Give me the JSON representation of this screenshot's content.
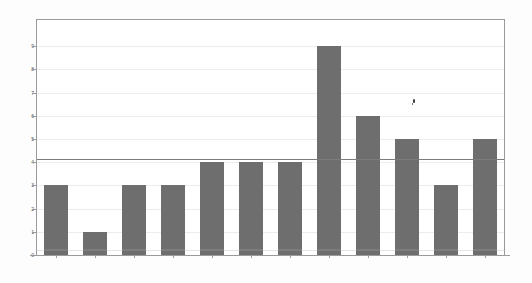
{
  "chart_data": {
    "type": "bar",
    "title": "",
    "subtitle": "",
    "xlabel": "",
    "ylabel": "",
    "categories": [
      "",
      "",
      "",
      "",
      "",
      "",
      "",
      "",
      "",
      "",
      "",
      ""
    ],
    "values": [
      3,
      1,
      3,
      3,
      4,
      4,
      4,
      9,
      6,
      5,
      3,
      5
    ],
    "ylim": [
      0,
      9.6
    ],
    "y_ticks": [
      0,
      1,
      2,
      3,
      4,
      5,
      6,
      7,
      8,
      9
    ],
    "y_tick_labels": [
      "0",
      "1",
      "2",
      "3",
      "4",
      "5",
      "6",
      "7",
      "8",
      "9"
    ],
    "grid": true,
    "grid_axis": "y",
    "legend": false,
    "legend_position": "none",
    "annotations": [
      {
        "name": "reference-line",
        "type": "hline",
        "value": 4.15,
        "color": "#7c7c7c"
      }
    ],
    "bar_color": "#6e6e6e",
    "grid_color": "#ececec",
    "axis_color": "#9a9a9a",
    "plot_background": "#ffffff",
    "figure_background": "#fdfdfd"
  },
  "axes": {
    "y_tick_labels": [
      "9",
      "8",
      "7",
      "6",
      "5",
      "4",
      "3",
      "2",
      "1",
      "0"
    ],
    "x_tick_labels": [
      "",
      "",
      "",
      "",
      "",
      "",
      "",
      "",
      "",
      "",
      "",
      ""
    ]
  },
  "artifacts": {
    "speck_label": "scan-speck"
  }
}
